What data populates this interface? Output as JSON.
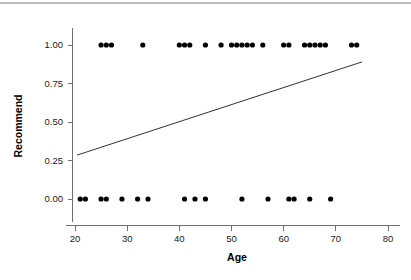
{
  "chart_data": {
    "type": "scatter",
    "title": "",
    "xlabel": "Age",
    "ylabel": "Recommend",
    "xlim": [
      17.5,
      82.5
    ],
    "ylim": [
      -0.18,
      1.18
    ],
    "xticks": [
      20,
      30,
      40,
      50,
      60,
      70,
      80
    ],
    "xticklabels": [
      "20",
      "30",
      "40",
      "50",
      "60",
      "70",
      "80"
    ],
    "yticks": [
      0.0,
      0.25,
      0.5,
      0.75,
      1.0
    ],
    "yticklabels": [
      "0.00",
      "0.25",
      "0.50",
      "0.75",
      "1.00"
    ],
    "grid": false,
    "legend": null,
    "marker": "filled-circle",
    "marker_color": "#000000",
    "points": [
      {
        "x": 25,
        "y": 1
      },
      {
        "x": 26,
        "y": 1
      },
      {
        "x": 27,
        "y": 1
      },
      {
        "x": 33,
        "y": 1
      },
      {
        "x": 40,
        "y": 1
      },
      {
        "x": 41,
        "y": 1
      },
      {
        "x": 42,
        "y": 1
      },
      {
        "x": 45,
        "y": 1
      },
      {
        "x": 48,
        "y": 1
      },
      {
        "x": 50,
        "y": 1
      },
      {
        "x": 51,
        "y": 1
      },
      {
        "x": 52,
        "y": 1
      },
      {
        "x": 53,
        "y": 1
      },
      {
        "x": 54,
        "y": 1
      },
      {
        "x": 56,
        "y": 1
      },
      {
        "x": 60,
        "y": 1
      },
      {
        "x": 61,
        "y": 1
      },
      {
        "x": 64,
        "y": 1
      },
      {
        "x": 65,
        "y": 1
      },
      {
        "x": 66,
        "y": 1
      },
      {
        "x": 67,
        "y": 1
      },
      {
        "x": 68,
        "y": 1
      },
      {
        "x": 73,
        "y": 1
      },
      {
        "x": 74,
        "y": 1
      },
      {
        "x": 21,
        "y": 0
      },
      {
        "x": 22,
        "y": 0
      },
      {
        "x": 25,
        "y": 0
      },
      {
        "x": 26,
        "y": 0
      },
      {
        "x": 29,
        "y": 0
      },
      {
        "x": 32,
        "y": 0
      },
      {
        "x": 34,
        "y": 0
      },
      {
        "x": 41,
        "y": 0
      },
      {
        "x": 43,
        "y": 0
      },
      {
        "x": 45,
        "y": 0
      },
      {
        "x": 52,
        "y": 0
      },
      {
        "x": 57,
        "y": 0
      },
      {
        "x": 61,
        "y": 0
      },
      {
        "x": 62,
        "y": 0
      },
      {
        "x": 65,
        "y": 0
      },
      {
        "x": 69,
        "y": 0
      }
    ],
    "fit_line": {
      "name": "linear fit",
      "color": "#1a1a1a",
      "x_start": 20.4,
      "y_start": 0.285,
      "x_end": 75.0,
      "y_end": 0.89
    }
  }
}
